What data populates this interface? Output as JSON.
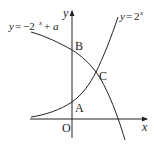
{
  "diagram": {
    "curves": [
      {
        "name": "exponential",
        "equation": "y=2^x",
        "label_parts": {
          "lhs": "y",
          "eq": "=",
          "base": "2",
          "exp": "x"
        }
      },
      {
        "name": "reflected-exponential",
        "equation": "y=-2^x+a",
        "label_parts": {
          "lhs": "y",
          "eq": "=",
          "neg": "−2",
          "exp": "x",
          "plus": "+",
          "param": "a"
        }
      }
    ],
    "axes": {
      "x_label": "x",
      "y_label": "y",
      "origin_label": "O"
    },
    "points": {
      "A": {
        "label": "A",
        "description": "y-intercept of y=2^x"
      },
      "B": {
        "label": "B",
        "description": "y-intercept of y=-2^x+a"
      },
      "C": {
        "label": "C",
        "description": "intersection of the two curves"
      }
    },
    "colors": {
      "stroke": "#222222",
      "background": "#ffffff"
    }
  }
}
